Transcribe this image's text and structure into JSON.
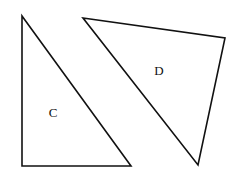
{
  "diagram": {
    "shapes": [
      {
        "id": "C",
        "label": "C",
        "type": "right-triangle",
        "points": "22,16 22,166 131,166",
        "label_pos": {
          "x": 53,
          "y": 117
        }
      },
      {
        "id": "D",
        "label": "D",
        "type": "triangle",
        "points": "83,18 225,38 198,165",
        "label_pos": {
          "x": 159,
          "y": 75
        }
      }
    ],
    "stroke_color": "#111111",
    "background": "#ffffff"
  }
}
